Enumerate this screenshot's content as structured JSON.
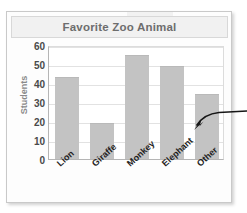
{
  "chart_data": {
    "type": "bar",
    "title": "Favorite Zoo Animal",
    "xlabel": "",
    "ylabel": "Students",
    "categories": [
      "Lion",
      "Giraffe",
      "Monkey",
      "Elephant",
      "Other"
    ],
    "values": [
      43,
      19,
      55,
      49,
      34
    ],
    "ylim": [
      0,
      60
    ],
    "yticks": [
      60,
      50,
      40,
      30,
      20,
      10,
      0
    ],
    "ytick_labels": [
      "60",
      "50",
      "40",
      "30",
      "20",
      "10",
      "0"
    ],
    "grid": "horizontal",
    "legend": "none",
    "bar_color": "#c3c3c3",
    "title_color": "#6d6d6d",
    "ylabel_color": "#8a8a8a",
    "annotations": [
      {
        "name": "callout-arrow",
        "text": "",
        "points_to": "Other",
        "style": "curved-arrow-from-right"
      }
    ]
  }
}
